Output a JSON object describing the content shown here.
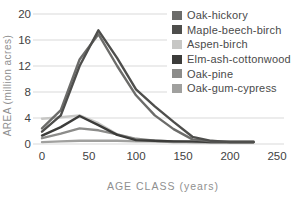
{
  "colors": {
    "background": "#ffffff",
    "gridline": "#d9d9d9",
    "tick_label": "#424242",
    "axis_title": "#8f8f8f",
    "legend_text": "#4a4a4a"
  },
  "chart_data": {
    "type": "line",
    "title": "",
    "xlabel": "AGE CLASS (years)",
    "ylabel": "AREA (million acres)",
    "xlim": [
      0,
      250
    ],
    "ylim": [
      0,
      20
    ],
    "x_ticks": [
      "0",
      "50",
      "100",
      "150",
      "200",
      "250"
    ],
    "y_ticks": [
      "20",
      "16",
      "12",
      "8",
      "4",
      "0"
    ],
    "grid": "horizontal",
    "legend_position": "top-right",
    "x": [
      0,
      20,
      40,
      60,
      80,
      100,
      120,
      140,
      160,
      180,
      200,
      225
    ],
    "series": [
      {
        "name": "Oak-hickory",
        "color": "#6c6c6a",
        "values": [
          2.4,
          5.2,
          13.0,
          16.9,
          12.0,
          7.5,
          4.4,
          2.3,
          0.7,
          0.4,
          0.4,
          0.4
        ]
      },
      {
        "name": "Maple-beech-birch",
        "color": "#4e4e4c",
        "values": [
          1.9,
          4.4,
          12.0,
          17.5,
          13.2,
          8.4,
          5.8,
          3.4,
          1.1,
          0.5,
          0.3,
          0.3
        ]
      },
      {
        "name": "Aspen-birch",
        "color": "#c7c7c5",
        "values": [
          3.9,
          4.1,
          4.4,
          3.2,
          1.5,
          0.7,
          0.4,
          0.3,
          0.3,
          0.2,
          0.2,
          0.2
        ]
      },
      {
        "name": "Elm-ash-cottonwood",
        "color": "#3c3c3a",
        "values": [
          1.3,
          2.6,
          4.3,
          2.9,
          1.4,
          0.6,
          0.5,
          0.4,
          0.4,
          0.3,
          0.3,
          0.3
        ]
      },
      {
        "name": "Oak-pine",
        "color": "#8c8c8a",
        "values": [
          0.9,
          1.6,
          2.4,
          2.1,
          1.5,
          0.8,
          0.5,
          0.4,
          0.3,
          0.3,
          0.3,
          0.3
        ]
      },
      {
        "name": "Oak-gum-cypress",
        "color": "#a0a09e",
        "values": [
          0.3,
          0.4,
          0.5,
          0.5,
          0.5,
          0.4,
          0.4,
          0.3,
          0.3,
          0.3,
          0.3,
          0.3
        ]
      }
    ]
  }
}
